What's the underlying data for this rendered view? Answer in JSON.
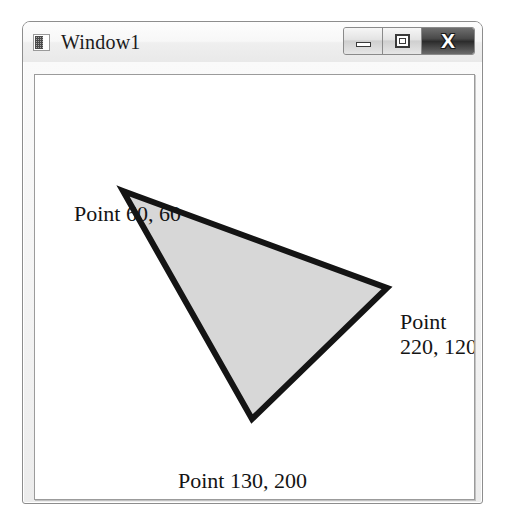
{
  "window": {
    "title": "Window1",
    "icon": "window-app-icon",
    "controls": {
      "minimize_label": "Minimize",
      "maximize_label": "Maximize",
      "close_label": "X"
    }
  },
  "canvas": {
    "shape": "triangle",
    "fill_color": "#d7d7d7",
    "stroke_color": "#141414",
    "stroke_width": 6,
    "vertices": [
      {
        "name": "point-a",
        "x": 60,
        "y": 60
      },
      {
        "name": "point-b",
        "x": 220,
        "y": 120
      },
      {
        "name": "point-c",
        "x": 130,
        "y": 200
      }
    ],
    "labels": {
      "a": "Point 60, 60",
      "b_line1": "Point",
      "b_line2": "220, 120",
      "c": "Point 130, 200"
    }
  }
}
